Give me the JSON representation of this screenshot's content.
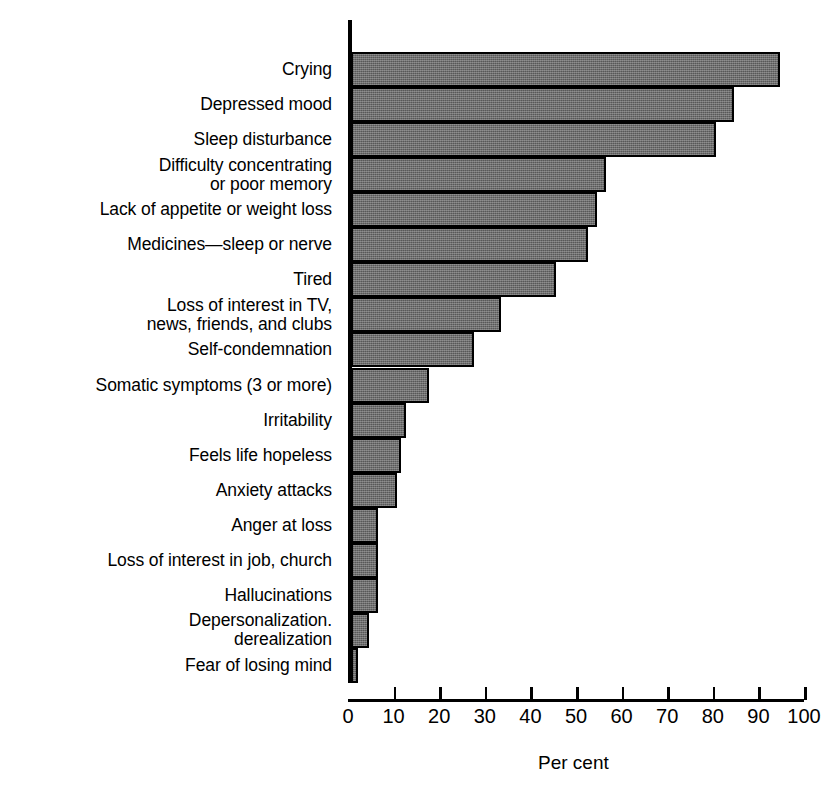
{
  "chart_data": {
    "type": "bar",
    "orientation": "horizontal",
    "title": "",
    "xlabel": "Per cent",
    "ylabel": "",
    "xlim": [
      0,
      100
    ],
    "grid": false,
    "legend": null,
    "xticks": [
      0,
      10,
      20,
      30,
      40,
      50,
      60,
      70,
      80,
      90,
      100
    ],
    "xticklabels": [
      "0",
      "10",
      "20",
      "30",
      "40",
      "50",
      "60",
      "70",
      "80",
      "90",
      "100"
    ],
    "categories": [
      "Crying",
      "Depressed mood",
      "Sleep disturbance",
      "Difficulty concentrating\nor poor memory",
      "Lack of appetite or weight loss",
      "Medicines—sleep or nerve",
      "Tired",
      "Loss of interest in TV,\nnews, friends, and clubs",
      "Self-condemnation",
      "Somatic symptoms (3 or more)",
      "Irritability",
      "Feels life hopeless",
      "Anxiety attacks",
      "Anger at loss",
      "Loss of interest in job, church",
      "Hallucinations",
      "Depersonalization.\nderealization",
      "Fear of losing mind"
    ],
    "values": [
      94,
      84,
      80,
      56,
      54,
      52,
      45,
      33,
      27,
      17,
      12,
      11,
      10,
      6,
      6,
      6,
      4,
      1.5
    ]
  },
  "axis": {
    "x_title": "Per cent"
  }
}
